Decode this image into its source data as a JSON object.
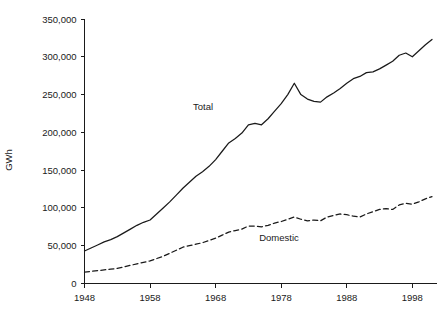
{
  "chart_data": {
    "type": "line",
    "title": "",
    "xlabel": "",
    "ylabel": "GWh",
    "xlim": [
      1948,
      2001
    ],
    "ylim": [
      0,
      350000
    ],
    "grid": false,
    "legend_position": "inline-annotations",
    "x_ticks": [
      1948,
      1958,
      1968,
      1978,
      1988,
      1998
    ],
    "x_tick_labels": [
      "1948",
      "1958",
      "1968",
      "1978",
      "1988",
      "1998"
    ],
    "y_ticks": [
      0,
      50000,
      100000,
      150000,
      200000,
      250000,
      300000,
      350000
    ],
    "y_tick_labels": [
      "0",
      "50,000",
      "100,000",
      "150,000",
      "200,000",
      "250,000",
      "300,000",
      "350,000"
    ],
    "x": [
      1948,
      1949,
      1950,
      1951,
      1952,
      1953,
      1954,
      1955,
      1956,
      1957,
      1958,
      1959,
      1960,
      1961,
      1962,
      1963,
      1964,
      1965,
      1966,
      1967,
      1968,
      1969,
      1970,
      1971,
      1972,
      1973,
      1974,
      1975,
      1976,
      1977,
      1978,
      1979,
      1980,
      1981,
      1982,
      1983,
      1984,
      1985,
      1986,
      1987,
      1988,
      1989,
      1990,
      1991,
      1992,
      1993,
      1994,
      1995,
      1996,
      1997,
      1998,
      1999,
      2000,
      2001
    ],
    "series": [
      {
        "name": "Total",
        "style": "solid",
        "label_annotation": "Total",
        "values": [
          43000,
          47000,
          51000,
          55000,
          58000,
          62000,
          67000,
          72000,
          77000,
          81000,
          84000,
          92000,
          100000,
          108000,
          117000,
          126000,
          134000,
          142000,
          148000,
          155000,
          164000,
          175000,
          186000,
          192000,
          199000,
          210000,
          212000,
          210000,
          218000,
          228000,
          238000,
          250000,
          265000,
          250000,
          244000,
          241000,
          240000,
          247000,
          252000,
          258000,
          265000,
          271000,
          274000,
          279000,
          280000,
          284000,
          289000,
          294000,
          302000,
          305000,
          300000,
          308000,
          316000,
          323000
        ]
      },
      {
        "name": "Domestic",
        "style": "dashed",
        "label_annotation": "Domestic",
        "values": [
          15000,
          16000,
          17000,
          18000,
          19000,
          20000,
          22000,
          24000,
          26000,
          28000,
          30000,
          33000,
          36000,
          40000,
          44000,
          48000,
          50000,
          52000,
          54000,
          57000,
          60000,
          64000,
          68000,
          70000,
          72000,
          76000,
          76000,
          75000,
          77000,
          80000,
          82000,
          85000,
          88000,
          85000,
          83000,
          84000,
          83000,
          88000,
          90000,
          92000,
          91000,
          89000,
          88000,
          92000,
          95000,
          98000,
          99000,
          98000,
          104000,
          106000,
          105000,
          108000,
          112000,
          115000
        ]
      }
    ]
  }
}
